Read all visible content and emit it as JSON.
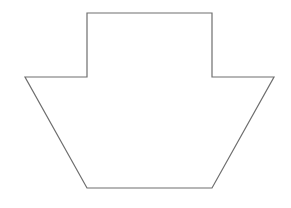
{
  "figure": {
    "width": 291,
    "height": 208,
    "background": "#ffffff",
    "shape": {
      "kind": "polygon",
      "description": "stepped shape: rectangle on top of an inverted trapezoid",
      "points": "87,13 212,13 212,77 274,77 212,188 87,188 25,77 87,77",
      "stroke": "#6e6e6e",
      "stroke_width": 1.2,
      "fill": "#ffffff"
    }
  }
}
